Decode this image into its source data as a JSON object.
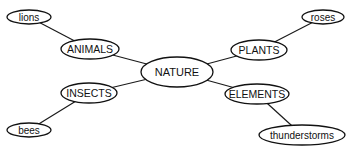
{
  "diagram": {
    "type": "mind-map",
    "colors": {
      "stroke": "#111111",
      "fill": "#ffffff",
      "text": "#111111"
    },
    "nodes": {
      "nature": {
        "label": "NATURE",
        "cx": 177,
        "cy": 72,
        "rx": 36,
        "ry": 15,
        "kind": "root"
      },
      "animals": {
        "label": "ANIMALS",
        "cx": 90,
        "cy": 49,
        "rx": 29,
        "ry": 10,
        "kind": "category"
      },
      "plants": {
        "label": "PLANTS",
        "cx": 259,
        "cy": 50,
        "rx": 28,
        "ry": 10,
        "kind": "category"
      },
      "insects": {
        "label": "INSECTS",
        "cx": 89,
        "cy": 93,
        "rx": 28,
        "ry": 10,
        "kind": "category"
      },
      "elements": {
        "label": "ELEMENTS",
        "cx": 257,
        "cy": 94,
        "rx": 32,
        "ry": 10,
        "kind": "category"
      },
      "lions": {
        "label": "lions",
        "cx": 29,
        "cy": 17,
        "rx": 22,
        "ry": 7,
        "kind": "leaf"
      },
      "roses": {
        "label": "roses",
        "cx": 323,
        "cy": 17,
        "rx": 21,
        "ry": 7,
        "kind": "leaf"
      },
      "bees": {
        "label": "bees",
        "cx": 29,
        "cy": 130,
        "rx": 22,
        "ry": 7,
        "kind": "leaf"
      },
      "thunderstorms": {
        "label": "thunderstorms",
        "cx": 302,
        "cy": 135,
        "rx": 43,
        "ry": 10,
        "kind": "leaf"
      }
    },
    "edges": [
      {
        "from": "nature",
        "to": "animals"
      },
      {
        "from": "nature",
        "to": "plants"
      },
      {
        "from": "nature",
        "to": "insects"
      },
      {
        "from": "nature",
        "to": "elements"
      },
      {
        "from": "animals",
        "to": "lions"
      },
      {
        "from": "plants",
        "to": "roses"
      },
      {
        "from": "insects",
        "to": "bees"
      },
      {
        "from": "elements",
        "to": "thunderstorms"
      }
    ]
  }
}
